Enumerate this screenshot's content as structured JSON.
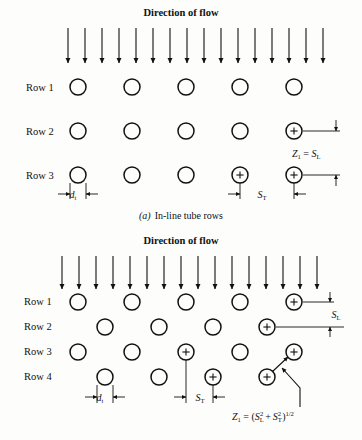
{
  "figure": {
    "background_color": "#fdfdfc",
    "ink_color": "#111111"
  },
  "panel_a": {
    "flow_label": "Direction of flow",
    "arrow_count": 16,
    "row_labels": [
      "Row 1",
      "Row 2",
      "Row 3"
    ],
    "caption": "(a)  In-line tube rows",
    "caption_letter": "(a)",
    "caption_text": "In-line tube rows",
    "dim_dt": "d",
    "dim_dt_sub": "t",
    "dim_st": "S",
    "dim_st_sub": "T",
    "formula": {
      "lhs": "Z",
      "lhs_sub": "1",
      "eq": "=",
      "rhs": "S",
      "rhs_sub": "L",
      "plain": "Z1 = SL"
    },
    "tube_columns": 5,
    "tube_rows": 3
  },
  "panel_b": {
    "flow_label": "Direction of flow",
    "arrow_count": 16,
    "row_labels": [
      "Row 1",
      "Row 2",
      "Row 3",
      "Row 4"
    ],
    "dim_dt": "d",
    "dim_dt_sub": "t",
    "dim_st": "S",
    "dim_st_sub": "T",
    "dim_sl": "S",
    "dim_sl_sub": "L",
    "formula": {
      "lhs": "Z",
      "lhs_sub": "1",
      "eq": "=",
      "open": "(",
      "term1": "S",
      "term1_sub": "L",
      "term1_sup": "2",
      "plus": "+",
      "term2": "S",
      "term2_sub": "T",
      "term2_sup": "2",
      "close": ")",
      "exp": "1/2",
      "plain": "Z1 = (SL^2 + ST^2)^1/2"
    },
    "tube_rows": 4
  }
}
